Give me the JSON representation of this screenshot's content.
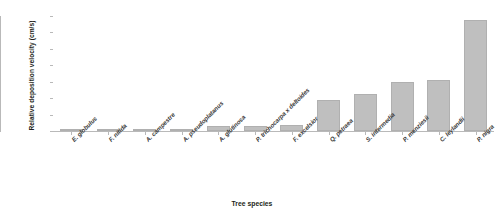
{
  "chart_data": {
    "type": "bar",
    "title": "",
    "xlabel": "Tree species",
    "ylabel": "Relative deposition velocity (cm/s)",
    "ylim": [
      0,
      7
    ],
    "yticks": [
      0,
      1,
      2,
      3,
      4,
      5,
      6,
      7
    ],
    "ytick_labels": [
      "0",
      "1",
      "2",
      "3",
      "4",
      "5",
      "6",
      "7"
    ],
    "grid": false,
    "legend": null,
    "bar_color": "#bfbfbf",
    "categories": [
      "E. globulus",
      "F. nitida",
      "A. campestre",
      "A. pseudoplatanus",
      "A. glutinosa",
      "P. trichocarpa x deltoides",
      "F. excelsior",
      "Q. petraea",
      "S. intermedia",
      "P. menziesii",
      "C. leylandii",
      "P. nigra"
    ],
    "values": [
      0.02,
      0.12,
      0.15,
      0.12,
      0.3,
      0.3,
      0.35,
      1.9,
      2.25,
      3.0,
      3.1,
      6.75
    ]
  }
}
